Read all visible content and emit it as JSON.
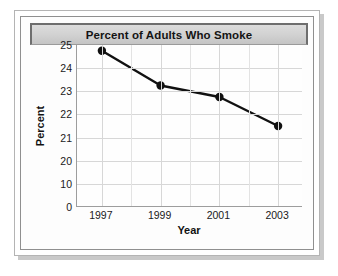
{
  "chart_data": {
    "type": "line",
    "title": "Percent of Adults Who Smoke",
    "xlabel": "Year",
    "ylabel": "Percent",
    "x": [
      1997,
      1999,
      2001,
      2003
    ],
    "categories": [
      "1997",
      "1999",
      "2001",
      "2003"
    ],
    "values": [
      24.75,
      23.25,
      22.75,
      21.5
    ],
    "series": [
      {
        "name": "Percent of adults who smoke",
        "values": [
          24.75,
          23.25,
          22.75,
          21.5
        ]
      }
    ],
    "x_tick_labels": [
      "1997",
      "1999",
      "2001",
      "2003"
    ],
    "y_tick_labels": [
      "0",
      "10",
      "20",
      "21",
      "22",
      "23",
      "24",
      "25"
    ],
    "y_axis_note": "broken axis: 0, 10, 20 then unit steps to 25, all evenly spaced",
    "xlim": [
      1996.5,
      2003.8
    ],
    "ylim_display": [
      "0",
      "25"
    ],
    "grid": true,
    "legend": "none",
    "marker": "filled-circle",
    "line_color": "#111111",
    "marker_color": "#111111",
    "grid_color": "#d7d7d7",
    "plot_background": "#fefefe",
    "title_banner_color": "#d2d2d2",
    "frame_color": "#8f8f8f"
  },
  "axes": {
    "y_ticks": [
      {
        "label": "0",
        "pos_pct": 100
      },
      {
        "label": "10",
        "pos_pct": 85.7
      },
      {
        "label": "20",
        "pos_pct": 71.4
      },
      {
        "label": "21",
        "pos_pct": 57.1
      },
      {
        "label": "22",
        "pos_pct": 42.9
      },
      {
        "label": "23",
        "pos_pct": 28.6
      },
      {
        "label": "24",
        "pos_pct": 14.3
      },
      {
        "label": "25",
        "pos_pct": 0
      }
    ],
    "x_ticks": [
      {
        "label": "1997",
        "pos_pct": 11
      },
      {
        "label": "1999",
        "pos_pct": 37
      },
      {
        "label": "2001",
        "pos_pct": 63
      },
      {
        "label": "2003",
        "pos_pct": 89
      }
    ],
    "x_minor_gridlines_pct": [
      24,
      50,
      76
    ]
  },
  "points": [
    {
      "year": "1997",
      "value": 24.75,
      "cx_pct": 11,
      "cy_pct": 3.6
    },
    {
      "year": "1999",
      "value": 23.25,
      "cx_pct": 37,
      "cy_pct": 25.0
    },
    {
      "year": "2001",
      "value": 22.75,
      "cx_pct": 63,
      "cy_pct": 32.1
    },
    {
      "year": "2003",
      "value": 21.5,
      "cx_pct": 89,
      "cy_pct": 50.0
    }
  ]
}
